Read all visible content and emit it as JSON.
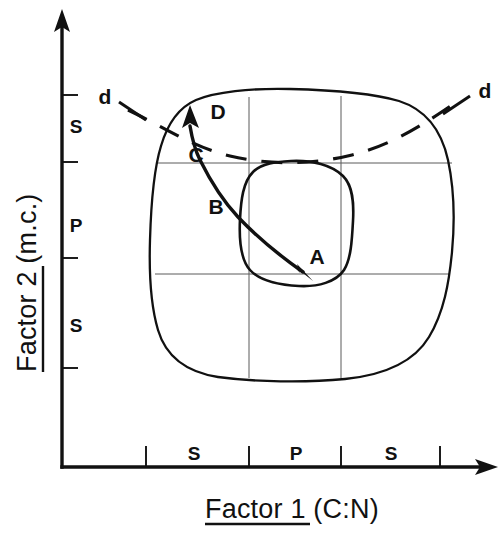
{
  "figure": {
    "kind": "hand-drawn-scientific-diagram",
    "background_color": "#ffffff",
    "ink_color": "#111111",
    "grid_color": "#5a5a5a"
  },
  "axes": {
    "x": {
      "title_main": "Factor 1",
      "title_paren": " (C:N)",
      "title_full": "Factor 1 (C:N)",
      "underlined_part": "Factor 1",
      "tick_labels": [
        "S",
        "P",
        "S"
      ],
      "tick_positions_px": [
        146,
        249,
        341,
        440
      ],
      "arrow": "right-arrow-icon"
    },
    "y": {
      "title_main": "Factor 2",
      "title_paren": " (m.c.)",
      "title_full": "Factor 2 (m.c.)",
      "underlined_part": "Factor 2",
      "tick_labels": [
        "S",
        "P",
        "S"
      ],
      "tick_positions_px": [
        95,
        162,
        258,
        368
      ],
      "arrow": "up-arrow-icon"
    }
  },
  "regions": {
    "outer_envelope_name": "outer-tolerance-envelope",
    "inner_envelope_name": "inner-optimum-envelope",
    "grid_name": "tolerance-grid"
  },
  "dashed_line": {
    "label_left": "d",
    "label_right": "d",
    "name": "decomposition-boundary"
  },
  "trajectory": {
    "name": "process-trajectory",
    "points": [
      {
        "label": "A",
        "x": 317,
        "y": 258
      },
      {
        "label": "B",
        "x": 216,
        "y": 208
      },
      {
        "label": "C",
        "x": 196,
        "y": 156
      },
      {
        "label": "D",
        "x": 218,
        "y": 113
      }
    ],
    "arrow_start": "arrowhead-at-D",
    "arrow_end": "arrowhead-at-A"
  }
}
